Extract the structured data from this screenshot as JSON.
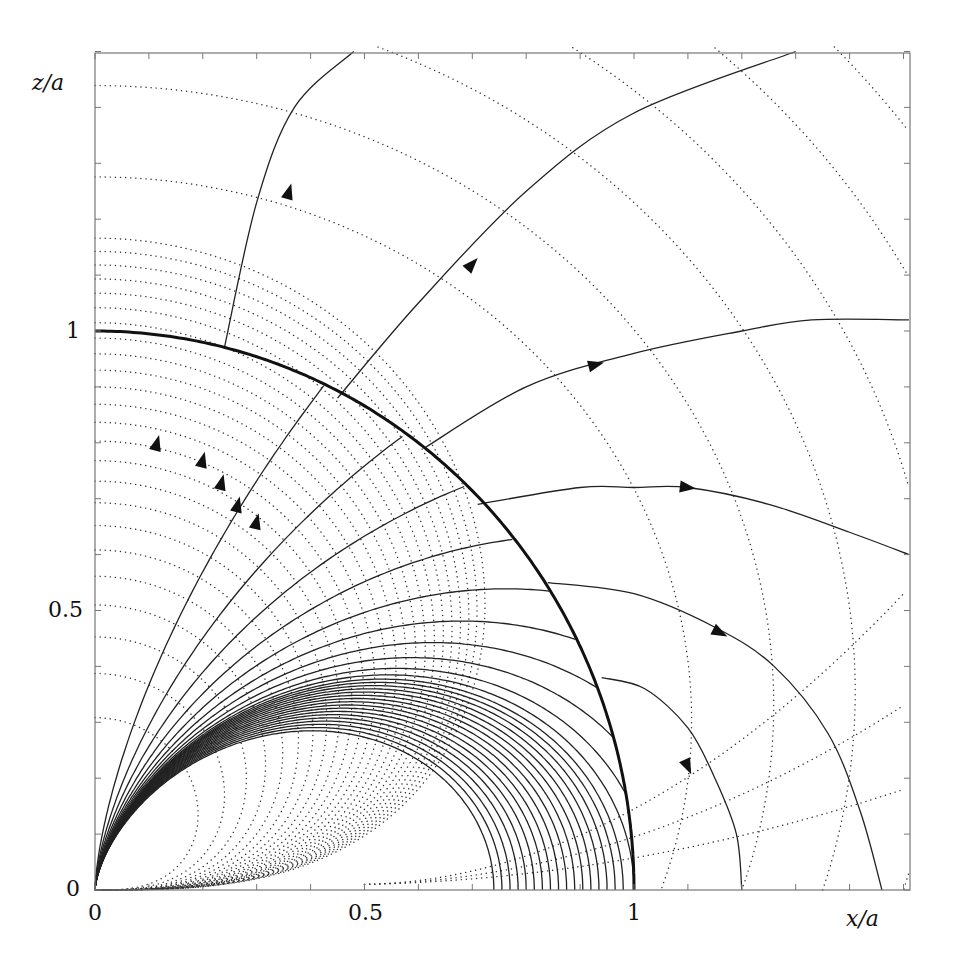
{
  "chart_data": {
    "type": "line",
    "title": "",
    "xlabel": "x/a",
    "ylabel": "z/a",
    "xlim": [
      0,
      1.5
    ],
    "ylim": [
      0,
      1.5
    ],
    "grid": false,
    "x_tick_labels": [
      "0",
      "0.5",
      "1"
    ],
    "y_tick_labels": [
      "0",
      "0.5",
      "1"
    ],
    "minor_tick_step": 0.1,
    "sphere": {
      "radius": 1.0,
      "style": "bold solid"
    },
    "interior_field_lines": {
      "form": "r = C sin^2(theta), theta measured from z-axis",
      "C_closed": [
        0.74,
        0.755,
        0.77,
        0.785,
        0.8,
        0.815,
        0.83,
        0.845,
        0.86,
        0.875,
        0.89,
        0.905,
        0.92,
        0.935,
        0.95,
        0.965,
        0.98,
        1.0
      ],
      "C_crossing": [
        1.03,
        1.08,
        1.15,
        1.25,
        1.4,
        1.65,
        2.1,
        3.0,
        5.5
      ]
    },
    "exterior_field_lines": [
      {
        "name": "line-1",
        "points": [
          [
            0.24,
            0.97
          ],
          [
            0.3,
            1.23
          ],
          [
            0.37,
            1.4
          ],
          [
            0.48,
            1.5
          ]
        ],
        "arrow_at": [
          0.36,
          1.25
        ]
      },
      {
        "name": "line-2",
        "points": [
          [
            0.45,
            0.88
          ],
          [
            0.6,
            1.05
          ],
          [
            0.8,
            1.25
          ],
          [
            1.0,
            1.39
          ],
          [
            1.3,
            1.5
          ]
        ],
        "arrow_at": [
          0.7,
          1.12
        ]
      },
      {
        "name": "line-3",
        "points": [
          [
            0.61,
            0.79
          ],
          [
            0.8,
            0.9
          ],
          [
            1.0,
            0.96
          ],
          [
            1.2,
            1.0
          ],
          [
            1.33,
            1.02
          ],
          [
            1.51,
            1.02
          ]
        ],
        "arrow_at": [
          0.93,
          0.94
        ]
      },
      {
        "name": "line-4",
        "points": [
          [
            0.71,
            0.69
          ],
          [
            0.9,
            0.72
          ],
          [
            1.0,
            0.72
          ],
          [
            1.1,
            0.72
          ],
          [
            1.25,
            0.69
          ],
          [
            1.4,
            0.64
          ],
          [
            1.51,
            0.6
          ]
        ],
        "arrow_at": [
          1.1,
          0.72
        ]
      },
      {
        "name": "line-5",
        "points": [
          [
            0.84,
            0.55
          ],
          [
            1.0,
            0.53
          ],
          [
            1.15,
            0.47
          ],
          [
            1.26,
            0.4
          ],
          [
            1.36,
            0.28
          ],
          [
            1.42,
            0.14
          ],
          [
            1.46,
            0.0
          ]
        ],
        "arrow_at": [
          1.16,
          0.46
        ]
      },
      {
        "name": "line-6",
        "points": [
          [
            0.94,
            0.38
          ],
          [
            1.02,
            0.36
          ],
          [
            1.1,
            0.29
          ],
          [
            1.15,
            0.2
          ],
          [
            1.19,
            0.1
          ],
          [
            1.2,
            0.0
          ]
        ],
        "arrow_at": [
          1.1,
          0.22
        ]
      }
    ],
    "interior_arrows_at": [
      [
        0.115,
        0.8
      ],
      [
        0.2,
        0.77
      ],
      [
        0.235,
        0.73
      ],
      [
        0.265,
        0.69
      ],
      [
        0.3,
        0.66
      ]
    ],
    "equipotential_lines": {
      "style": "dotted",
      "description": "family of dotted curves orthogonal to field lines, concentric arcs inside and outside sphere",
      "inner_count": 24,
      "outer_radii": [
        1.05,
        1.2,
        1.35,
        1.5,
        1.65,
        1.8
      ]
    }
  },
  "axes": {
    "x_label": "x/a",
    "y_label": "z/a",
    "x_ticks": [
      "0",
      "0.5",
      "1"
    ],
    "y_ticks": [
      "0",
      "0.5",
      "1"
    ]
  }
}
